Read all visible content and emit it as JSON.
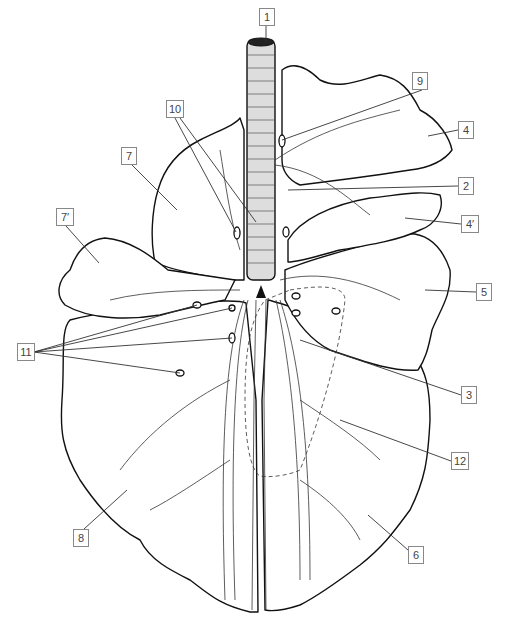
{
  "diagram": {
    "labels": [
      {
        "id": "1",
        "text": "1",
        "x": 259,
        "y": 8
      },
      {
        "id": "2",
        "text": "2",
        "x": 458,
        "y": 177
      },
      {
        "id": "3",
        "text": "3",
        "x": 461,
        "y": 386
      },
      {
        "id": "4",
        "text": "4",
        "x": 458,
        "y": 121
      },
      {
        "id": "4p",
        "text": "4′",
        "x": 461,
        "y": 215
      },
      {
        "id": "5",
        "text": "5",
        "x": 476,
        "y": 283
      },
      {
        "id": "6",
        "text": "6",
        "x": 408,
        "y": 546
      },
      {
        "id": "7",
        "text": "7",
        "x": 121,
        "y": 147
      },
      {
        "id": "7p",
        "text": "7′",
        "x": 56,
        "y": 208
      },
      {
        "id": "8",
        "text": "8",
        "x": 73,
        "y": 529
      },
      {
        "id": "9",
        "text": "9",
        "x": 412,
        "y": 72
      },
      {
        "id": "10",
        "text": "10",
        "x": 166,
        "y": 100
      },
      {
        "id": "11",
        "text": "11",
        "x": 17,
        "y": 343
      },
      {
        "id": "12",
        "text": "12",
        "x": 451,
        "y": 452
      }
    ],
    "markers": {
      "bifurcation_symbol": "black-triangle"
    }
  }
}
